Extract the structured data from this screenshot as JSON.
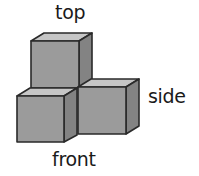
{
  "labels": {
    "top": "top",
    "side": "side",
    "front": "front"
  },
  "colors": {
    "front_face": "#9b9b9b",
    "side_face": "#838383",
    "top_face": "#c6c6c6",
    "edge": "#2a2a2a"
  },
  "figure": {
    "cubes": [
      {
        "name": "top-cube",
        "x": 31,
        "y": 41,
        "size": 48
      },
      {
        "name": "front-cube",
        "x": 17,
        "y": 96,
        "size": 47
      },
      {
        "name": "side-cube",
        "x": 78,
        "y": 87,
        "size": 48
      }
    ]
  }
}
